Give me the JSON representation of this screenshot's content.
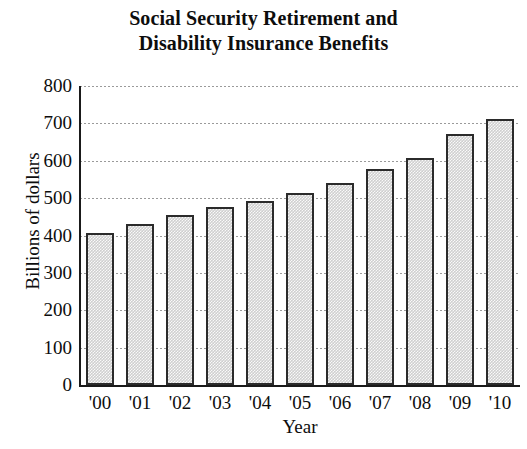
{
  "chart_data": {
    "type": "bar",
    "title": "Social Security Retirement and Disability Insurance Benefits",
    "title_lines": [
      "Social Security Retirement and",
      "Disability Insurance Benefits"
    ],
    "xlabel": "Year",
    "ylabel": "Billions of dollars",
    "categories": [
      "'00",
      "'01",
      "'02",
      "'03",
      "'04",
      "'05",
      "'06",
      "'07",
      "'08",
      "'09",
      "'10"
    ],
    "values": [
      406,
      431,
      454,
      475,
      493,
      513,
      541,
      577,
      607,
      671,
      711
    ],
    "ylim": [
      0,
      800
    ],
    "ytick_labels": [
      "0",
      "100",
      "200",
      "300",
      "400",
      "500",
      "600",
      "700",
      "800"
    ],
    "ytick_values": [
      0,
      100,
      200,
      300,
      400,
      500,
      600,
      700,
      800
    ],
    "grid": "horizontal-dotted",
    "legend": "none",
    "bar_fill_color": "#cfcfcf",
    "bar_edge_color": "#2b2b2b",
    "axis_color": "#1a1a1a",
    "grid_color": "#9a9a9a",
    "text_color": "#0d0d0d"
  }
}
